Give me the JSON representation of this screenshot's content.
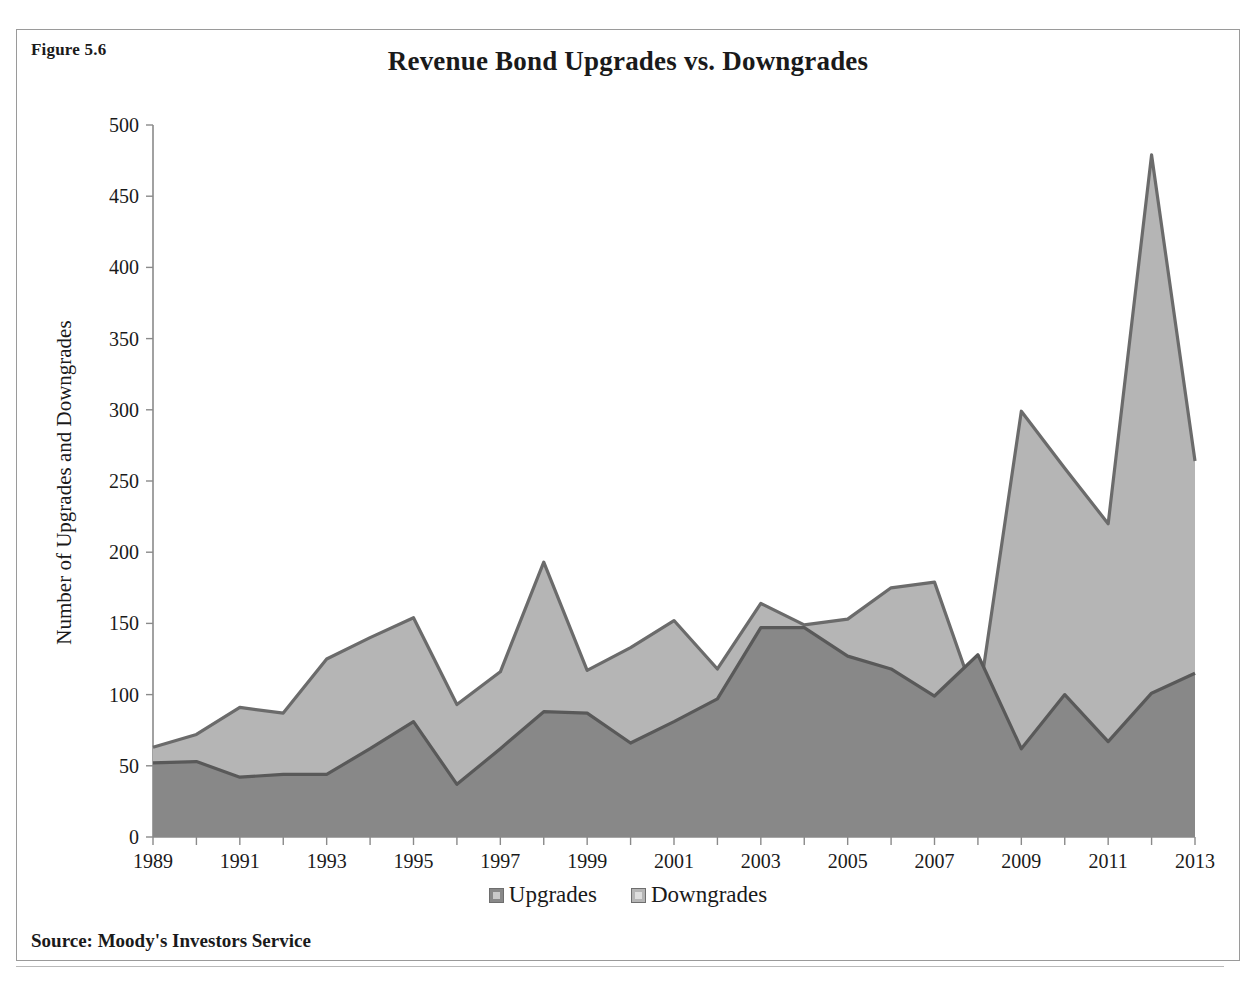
{
  "figure": {
    "number_label": "Figure 5.6",
    "source_note": "Source: Moody's Investors Service"
  },
  "chart_data": {
    "type": "area",
    "title": "Revenue Bond Upgrades vs. Downgrades",
    "xlabel": "",
    "ylabel": "Number of Upgrades and Downgrades",
    "ylim": [
      0,
      500
    ],
    "ytick_step": 50,
    "yticks": [
      0,
      50,
      100,
      150,
      200,
      250,
      300,
      350,
      400,
      450,
      500
    ],
    "ytick_labels": [
      "0",
      "50",
      "100",
      "150",
      "200",
      "250",
      "300",
      "350",
      "400",
      "450",
      "500"
    ],
    "xlim": [
      1989,
      2013
    ],
    "grid": false,
    "legend_position": "bottom-center",
    "stacked": false,
    "categories": [
      1989,
      1990,
      1991,
      1992,
      1993,
      1994,
      1995,
      1996,
      1997,
      1998,
      1999,
      2000,
      2001,
      2002,
      2003,
      2004,
      2005,
      2006,
      2007,
      2008,
      2009,
      2010,
      2011,
      2012,
      2013
    ],
    "xtick_labels": [
      "1989",
      "1990",
      "1991",
      "1992",
      "1993",
      "1994",
      "1995",
      "1996",
      "1997",
      "1998",
      "1999",
      "2000",
      "2001",
      "2002",
      "2003",
      "2004",
      "2005",
      "2006",
      "2007",
      "2008",
      "2009",
      "2010",
      "2011",
      "2012",
      "2013"
    ],
    "xtick_labels_shown": [
      "1989",
      "1991",
      "1993",
      "1995",
      "1997",
      "1999",
      "2001",
      "2003",
      "2005",
      "2007",
      "2009",
      "2011",
      "2013"
    ],
    "series": [
      {
        "name": "Upgrades",
        "color": "#888888",
        "line_color": "#595959",
        "values": [
          52,
          53,
          42,
          44,
          44,
          62,
          81,
          37,
          62,
          88,
          87,
          66,
          81,
          97,
          147,
          147,
          127,
          118,
          99,
          128,
          62,
          100,
          67,
          101,
          115
        ]
      },
      {
        "name": "Downgrades",
        "color": "#b5b5b5",
        "line_color": "#6b6b6b",
        "values": [
          63,
          72,
          91,
          87,
          125,
          140,
          154,
          93,
          116,
          193,
          117,
          133,
          152,
          118,
          164,
          149,
          153,
          175,
          179,
          92,
          299,
          259,
          220,
          479,
          264
        ]
      }
    ]
  },
  "legend": {
    "entries": [
      {
        "label": "Upgrades",
        "color": "#888888"
      },
      {
        "label": "Downgrades",
        "color": "#b5b5b5"
      }
    ]
  },
  "colors": {
    "upgrades_fill": "#888888",
    "downgrades_fill": "#b5b5b5",
    "outline": "#5e5e5e",
    "axis": "#8a8a8a",
    "border": "#9a9a9a",
    "text": "#1a1a1a"
  }
}
